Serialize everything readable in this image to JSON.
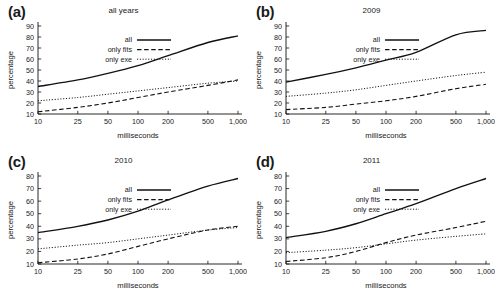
{
  "figure": {
    "xlabel": "milliseconds",
    "ylabel": "percentage",
    "xticks": [
      "10",
      "25",
      "50",
      "100",
      "200",
      "500",
      "1,000"
    ],
    "xtick_values": [
      10,
      25,
      50,
      100,
      200,
      500,
      1000
    ],
    "legend": [
      "all",
      "only fits",
      "only exe"
    ]
  },
  "chart_data": [
    {
      "type": "line",
      "panel": "(a)",
      "title": "all years",
      "xlabel": "milliseconds",
      "ylabel": "percentage",
      "xscale": "log",
      "xlim": [
        10,
        1000
      ],
      "ylim": [
        10,
        90
      ],
      "yticks": [
        10,
        20,
        30,
        40,
        50,
        60,
        70,
        80,
        90
      ],
      "x": [
        10,
        25,
        50,
        100,
        200,
        500,
        1000
      ],
      "grid": false,
      "legend_position": "upper-center",
      "series": [
        {
          "name": "all",
          "style": "solid",
          "values": [
            35,
            41,
            47,
            54,
            63,
            75,
            81
          ]
        },
        {
          "name": "only fits",
          "style": "dashed",
          "values": [
            12,
            16,
            20,
            25,
            30,
            36,
            41
          ]
        },
        {
          "name": "only exe",
          "style": "dotted",
          "values": [
            22,
            25,
            28,
            31,
            34,
            38,
            40
          ]
        }
      ]
    },
    {
      "type": "line",
      "panel": "(b)",
      "title": "2009",
      "xlabel": "milliseconds",
      "ylabel": "percentage",
      "xscale": "log",
      "xlim": [
        10,
        1000
      ],
      "ylim": [
        10,
        90
      ],
      "yticks": [
        10,
        20,
        30,
        40,
        50,
        60,
        70,
        80,
        90
      ],
      "x": [
        10,
        25,
        50,
        100,
        200,
        500,
        1000
      ],
      "grid": false,
      "legend_position": "upper-center",
      "series": [
        {
          "name": "all",
          "style": "solid",
          "values": [
            39,
            46,
            52,
            59,
            66,
            82,
            86
          ]
        },
        {
          "name": "only fits",
          "style": "dashed",
          "values": [
            14,
            16,
            19,
            22,
            26,
            33,
            37
          ]
        },
        {
          "name": "only exe",
          "style": "dotted",
          "values": [
            26,
            29,
            32,
            36,
            40,
            45,
            48
          ]
        }
      ]
    },
    {
      "type": "line",
      "panel": "(c)",
      "title": "2010",
      "xlabel": "milliseconds",
      "ylabel": "percentage",
      "xscale": "log",
      "xlim": [
        10,
        1000
      ],
      "ylim": [
        10,
        80
      ],
      "yticks": [
        10,
        20,
        30,
        40,
        50,
        60,
        70,
        80
      ],
      "x": [
        10,
        25,
        50,
        100,
        200,
        500,
        1000
      ],
      "grid": false,
      "legend_position": "upper-center",
      "series": [
        {
          "name": "all",
          "style": "solid",
          "values": [
            35,
            40,
            45,
            52,
            61,
            72,
            78
          ]
        },
        {
          "name": "only fits",
          "style": "dashed",
          "values": [
            11,
            14,
            18,
            24,
            30,
            37,
            40
          ]
        },
        {
          "name": "only exe",
          "style": "dotted",
          "values": [
            22,
            25,
            27,
            30,
            33,
            37,
            39
          ]
        }
      ]
    },
    {
      "type": "line",
      "panel": "(d)",
      "title": "2011",
      "xlabel": "milliseconds",
      "ylabel": "percentage",
      "xscale": "log",
      "xlim": [
        10,
        1000
      ],
      "ylim": [
        10,
        80
      ],
      "yticks": [
        10,
        20,
        30,
        40,
        50,
        60,
        70,
        80
      ],
      "x": [
        10,
        25,
        50,
        100,
        200,
        500,
        1000
      ],
      "grid": false,
      "legend_position": "upper-center",
      "series": [
        {
          "name": "all",
          "style": "solid",
          "values": [
            31,
            36,
            42,
            50,
            58,
            70,
            78
          ]
        },
        {
          "name": "only fits",
          "style": "dashed",
          "values": [
            12,
            15,
            20,
            27,
            33,
            39,
            44
          ]
        },
        {
          "name": "only exe",
          "style": "dotted",
          "values": [
            19,
            21,
            23,
            26,
            29,
            32,
            34
          ]
        }
      ]
    }
  ]
}
